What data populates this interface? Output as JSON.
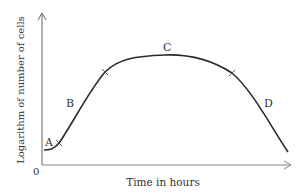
{
  "diagram": {
    "x_axis_label": "Time in hours",
    "y_axis_label": "Logarithm of number of cells",
    "origin_label": "0",
    "phase_labels": [
      {
        "id": "A",
        "label": "A"
      },
      {
        "id": "B",
        "label": "B"
      },
      {
        "id": "C",
        "label": "C"
      },
      {
        "id": "D",
        "label": "D"
      }
    ],
    "colors": {
      "line": "#2a2a2a",
      "axis": "#555555",
      "text": "#333333"
    }
  }
}
